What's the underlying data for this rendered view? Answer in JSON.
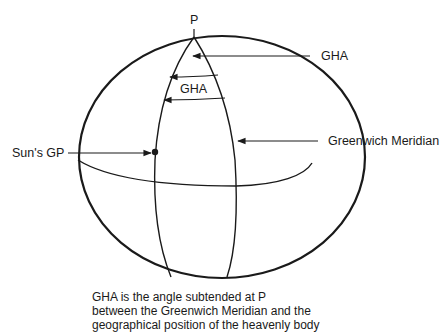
{
  "diagram": {
    "type": "celestial-sphere",
    "labels": {
      "pole": "P",
      "gha_top": "GHA",
      "gha_inner": "GHA",
      "sun_gp": "Sun's GP",
      "greenwich": "Greenwich Meridian"
    },
    "caption": [
      "GHA is the angle subtended at P",
      "between the Greenwich Meridian and the",
      "geographical position of the heavenly body"
    ],
    "colors": {
      "line": "#1a1a1a",
      "background": "#ffffff"
    }
  }
}
